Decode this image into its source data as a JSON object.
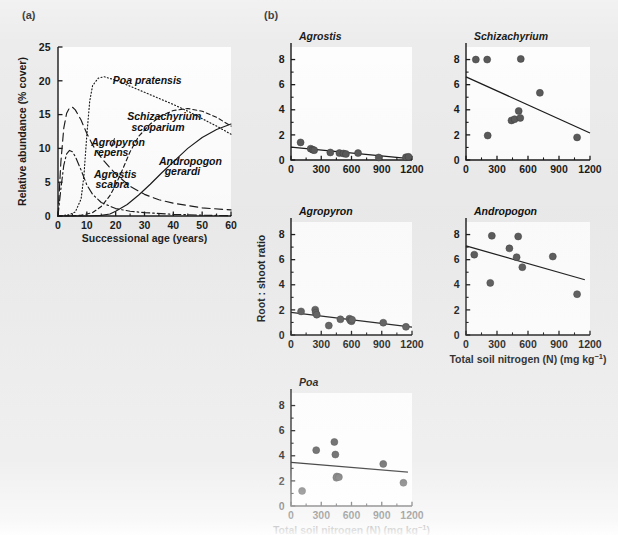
{
  "figure": {
    "background_color": "#ececec",
    "ink_color": "#1b1b1b",
    "marker_color": "#5a5a5a",
    "panel_bg": "#fdfdfd"
  },
  "panel_a": {
    "label": "(a)",
    "xlabel": "Successional age (years)",
    "ylabel": "Relative abundance (% cover)",
    "xticks": [
      0,
      10,
      20,
      30,
      40,
      50,
      60
    ],
    "yticks": [
      0,
      5,
      10,
      15,
      20,
      25
    ],
    "xlim": [
      0,
      60
    ],
    "ylim": [
      0,
      25
    ],
    "annotations": [
      {
        "name": "poa-pratensis",
        "text": "Poa pratensis",
        "x": 19,
        "y": 19.6
      },
      {
        "name": "schizachyrium-scoparium",
        "text": "Schizachyrium",
        "x": 24,
        "y": 14.2
      },
      {
        "name": "schizachyrium-scoparium-2",
        "text": "scoparium",
        "x": 25.5,
        "y": 12.6
      },
      {
        "name": "agropyron-repens",
        "text": "Agropyron",
        "x": 11.5,
        "y": 10.4
      },
      {
        "name": "agropyron-repens-2",
        "text": "repens",
        "x": 12.5,
        "y": 8.9
      },
      {
        "name": "agrostis-scabra",
        "text": "Agrostis",
        "x": 12.5,
        "y": 5.6
      },
      {
        "name": "agrostis-scabra-2",
        "text": "scabra",
        "x": 13,
        "y": 4.1
      },
      {
        "name": "andropogon-gerardi",
        "text": "Andropogon",
        "x": 35,
        "y": 7.6
      },
      {
        "name": "andropogon-gerardi-2",
        "text": "gerardi",
        "x": 37,
        "y": 6.1
      }
    ],
    "chart_data": {
      "type": "line",
      "title": "",
      "xlabel": "Successional age (years)",
      "ylabel": "Relative abundance (% cover)",
      "xlim": [
        0,
        60
      ],
      "ylim": [
        0,
        25
      ],
      "grid": false,
      "legend": "inline-annotations",
      "series": [
        {
          "name": "Agrostis scabra",
          "style": "dashdot",
          "x": [
            0,
            1,
            2,
            3,
            4,
            5,
            6,
            8,
            10,
            12,
            15,
            20,
            25,
            30,
            40,
            50,
            60
          ],
          "y": [
            0,
            4.0,
            7.5,
            9.2,
            9.7,
            9.5,
            8.8,
            6.8,
            4.6,
            3.2,
            2.0,
            1.1,
            0.7,
            0.5,
            0.25,
            0.12,
            0.05
          ]
        },
        {
          "name": "Agropyron repens",
          "style": "longdash",
          "x": [
            0,
            1,
            2,
            3,
            4,
            5,
            6,
            8,
            10,
            12,
            14,
            16,
            20,
            25,
            30,
            35,
            40,
            50,
            60
          ],
          "y": [
            0,
            8.0,
            13.0,
            15.2,
            16.0,
            16.1,
            15.7,
            14.2,
            12.2,
            10.5,
            9.2,
            8.1,
            6.2,
            4.4,
            3.2,
            2.4,
            1.9,
            1.2,
            0.9
          ]
        },
        {
          "name": "Poa pratensis",
          "style": "dotted",
          "x": [
            0,
            4,
            6,
            8,
            9,
            10,
            11,
            12,
            14,
            16,
            20,
            25,
            30,
            35,
            40,
            45,
            50,
            55,
            60
          ],
          "y": [
            0,
            0.2,
            0.6,
            2.5,
            6.0,
            12.0,
            17.0,
            19.3,
            20.4,
            20.6,
            20.1,
            19.2,
            18.3,
            17.4,
            16.5,
            15.5,
            14.4,
            13.3,
            12.1
          ]
        },
        {
          "name": "Schizachyrium scoparium",
          "style": "shortdash",
          "x": [
            0,
            8,
            12,
            15,
            18,
            20,
            22,
            25,
            28,
            32,
            36,
            40,
            45,
            50,
            55,
            60
          ],
          "y": [
            0,
            0.1,
            0.5,
            1.4,
            3.0,
            4.6,
            6.5,
            9.5,
            11.8,
            13.6,
            14.9,
            15.6,
            15.9,
            15.5,
            14.6,
            13.3
          ]
        },
        {
          "name": "Andropogon gerardi",
          "style": "solid",
          "x": [
            0,
            10,
            15,
            18,
            20,
            24,
            28,
            32,
            36,
            40,
            45,
            50,
            55,
            60
          ],
          "y": [
            0,
            0,
            0.1,
            0.3,
            0.7,
            1.7,
            3.1,
            4.7,
            6.4,
            8.0,
            10.0,
            11.6,
            12.8,
            13.6
          ]
        }
      ]
    }
  },
  "panel_b": {
    "label": "(b)",
    "shared_ylabel": "Root : shoot ratio",
    "shared_xlabel_html": "Total soil nitrogen (N)  (mg kg",
    "shared_xlabel_sup": "−1",
    "shared_xlabel_tail": ")",
    "shared_xlabel": "Total soil nitrogen (N)  (mg kg−1)",
    "xticks": [
      0,
      300,
      600,
      900,
      1200
    ],
    "yticks": [
      0,
      2,
      4,
      6,
      8
    ],
    "xlim": [
      0,
      1200
    ],
    "ylim": [
      0,
      9
    ],
    "subplots": [
      {
        "id": "agrostis",
        "title": "Agrostis",
        "show_xlabel": false,
        "show_ylabel": false,
        "chart_data": {
          "type": "scatter",
          "title": "Agrostis",
          "xlabel": "Total soil nitrogen (N)  (mg kg−1)",
          "ylabel": "Root : shoot ratio",
          "xlim": [
            0,
            1200
          ],
          "ylim": [
            0,
            9
          ],
          "grid": false,
          "x": [
            95,
            195,
            215,
            230,
            390,
            480,
            520,
            545,
            665,
            870,
            1140,
            1165
          ],
          "y": [
            1.4,
            0.9,
            0.82,
            0.78,
            0.6,
            0.55,
            0.52,
            0.48,
            0.55,
            0.2,
            0.22,
            0.25
          ],
          "trendline": {
            "x": [
              0,
              1200
            ],
            "y": [
              1.02,
              0.08
            ]
          }
        }
      },
      {
        "id": "schizachyrium",
        "title": "Schizachyrium",
        "show_xlabel": false,
        "show_ylabel": false,
        "chart_data": {
          "type": "scatter",
          "title": "Schizachyrium",
          "xlabel": "Total soil nitrogen (N)  (mg kg−1)",
          "ylabel": "Root : shoot ratio",
          "xlim": [
            0,
            1200
          ],
          "ylim": [
            0,
            9
          ],
          "grid": false,
          "x": [
            95,
            205,
            210,
            440,
            470,
            510,
            525,
            530,
            715,
            1075
          ],
          "y": [
            8.0,
            8.0,
            1.95,
            3.15,
            3.25,
            3.9,
            3.35,
            8.05,
            5.35,
            1.8
          ],
          "trendline": {
            "x": [
              0,
              1200
            ],
            "y": [
              6.62,
              2.15
            ]
          }
        }
      },
      {
        "id": "agropyron",
        "title": "Agropyron",
        "show_xlabel": false,
        "show_ylabel": true,
        "chart_data": {
          "type": "scatter",
          "title": "Agropyron",
          "xlabel": "Total soil nitrogen (N)  (mg kg−1)",
          "ylabel": "Root : shoot ratio",
          "xlim": [
            0,
            1200
          ],
          "ylim": [
            0,
            9
          ],
          "grid": false,
          "x": [
            100,
            240,
            245,
            255,
            375,
            490,
            580,
            590,
            600,
            605,
            915,
            1140
          ],
          "y": [
            1.88,
            2.02,
            1.78,
            1.62,
            0.75,
            1.25,
            1.3,
            1.15,
            1.1,
            1.22,
            0.98,
            0.65
          ],
          "trendline": {
            "x": [
              0,
              1200
            ],
            "y": [
              1.8,
              0.62
            ]
          }
        }
      },
      {
        "id": "andropogon",
        "title": "Andropogon",
        "show_xlabel": true,
        "show_ylabel": false,
        "chart_data": {
          "type": "scatter",
          "title": "Andropogon",
          "xlabel": "Total soil nitrogen (N)  (mg kg−1)",
          "ylabel": "Root : shoot ratio",
          "xlim": [
            0,
            1200
          ],
          "ylim": [
            0,
            9
          ],
          "grid": false,
          "x": [
            80,
            235,
            250,
            420,
            490,
            505,
            545,
            840,
            1075
          ],
          "y": [
            6.4,
            4.15,
            7.9,
            6.9,
            6.2,
            7.85,
            5.4,
            6.25,
            3.25
          ],
          "trendline": {
            "x": [
              0,
              1150
            ],
            "y": [
              7.1,
              4.4
            ]
          }
        }
      },
      {
        "id": "poa",
        "title": "Poa",
        "show_xlabel": true,
        "show_ylabel": false,
        "chart_data": {
          "type": "scatter",
          "title": "Poa",
          "xlabel": "Total soil nitrogen (N)  (mg kg−1)",
          "ylabel": "Root : shoot ratio",
          "xlim": [
            0,
            1200
          ],
          "ylim": [
            0,
            9
          ],
          "grid": false,
          "x": [
            110,
            250,
            430,
            440,
            450,
            455,
            475,
            915,
            1115
          ],
          "y": [
            1.2,
            4.45,
            5.1,
            4.1,
            2.25,
            2.35,
            2.3,
            3.35,
            1.85
          ],
          "trendline": {
            "x": [
              0,
              1160
            ],
            "y": [
              3.48,
              2.7
            ]
          }
        }
      }
    ]
  }
}
